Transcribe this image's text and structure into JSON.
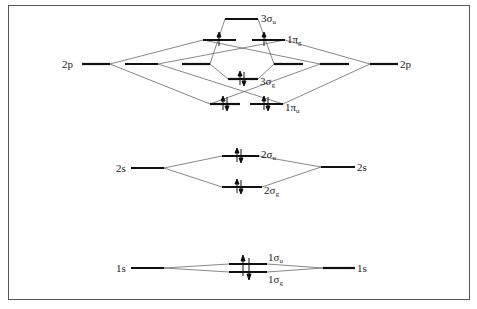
{
  "diagram": {
    "type": "molecular-orbital-diagram",
    "colors": {
      "line": "#111111",
      "connector": "#555555",
      "frame": "#555555",
      "background": "#ffffff"
    },
    "atomic_orbitals": {
      "left": [
        {
          "label": "2p",
          "y": 64
        },
        {
          "label": "2s",
          "y": 168
        },
        {
          "label": "1s",
          "y": 268
        }
      ],
      "right": [
        {
          "label": "2p",
          "y": 64
        },
        {
          "label": "2s",
          "y": 167
        },
        {
          "label": "1s",
          "y": 268
        }
      ]
    },
    "molecular_orbitals": [
      {
        "name": "3σu",
        "main": "3σ",
        "sub": "u",
        "electrons": 0
      },
      {
        "name": "1πg",
        "main": "1π",
        "sub": "g",
        "electrons": 2,
        "degenerate": 2
      },
      {
        "name": "3σg",
        "main": "3σ",
        "sub": "g",
        "electrons": 2
      },
      {
        "name": "1πu",
        "main": "1π",
        "sub": "u",
        "electrons": 4,
        "degenerate": 2
      },
      {
        "name": "2σu",
        "main": "2σ",
        "sub": "u",
        "electrons": 2
      },
      {
        "name": "2σg",
        "main": "2σ",
        "sub": "g",
        "electrons": 2
      },
      {
        "name": "1σu",
        "main": "1σ",
        "sub": "u",
        "electrons": 2
      },
      {
        "name": "1σg",
        "main": "1σ",
        "sub": "g",
        "electrons": 2
      }
    ],
    "labels": {
      "left_2p": "2p",
      "right_2p": "2p",
      "left_2s": "2s",
      "right_2s": "2s",
      "left_1s": "1s",
      "right_1s": "1s",
      "mo_3su_main": "3σ",
      "mo_3su_sub": "u",
      "mo_1pg_main": "1π",
      "mo_1pg_sub": "g",
      "mo_3sg_main": "3σ",
      "mo_3sg_sub": "g",
      "mo_1pu_main": "1π",
      "mo_1pu_sub": "u",
      "mo_2su_main": "2σ",
      "mo_2su_sub": "u",
      "mo_2sg_main": "2σ",
      "mo_2sg_sub": "g",
      "mo_1su_main": "1σ",
      "mo_1su_sub": "u",
      "mo_1sg_main": "1σ",
      "mo_1sg_sub": "g"
    }
  }
}
